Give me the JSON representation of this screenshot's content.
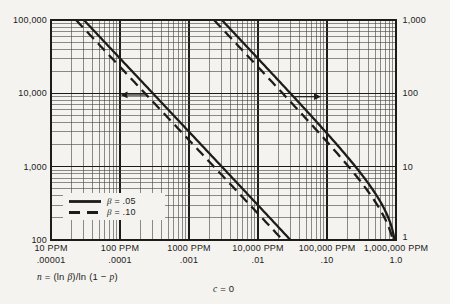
{
  "figure": {
    "paper_color": "#f4f3ef",
    "ink_color": "#1d1c1a",
    "grid_minor_color": "#45423e"
  },
  "chart_data": {
    "type": "line",
    "title": "",
    "equation": "n = (ln β)/ln (1 − p)",
    "grid": {
      "minor": true,
      "scale": "log-log"
    },
    "x_axis": {
      "scale": "log",
      "min": 1e-05,
      "max": 1.0,
      "tick_values": [
        1e-05,
        0.0001,
        0.001,
        0.01,
        0.1,
        1.0
      ],
      "ppm_labels": [
        "10 PPM",
        "100 PPM",
        "1000 PPM",
        "10,000 PPM",
        "100,000 PPM",
        "1,000,000 PPM"
      ],
      "fraction_labels": [
        ".00001",
        ".0001",
        ".001",
        ".01",
        ".10",
        "1.0"
      ]
    },
    "left_axis": {
      "scale": "log",
      "min": 100,
      "max": 100000,
      "tick_values": [
        100000,
        10000,
        1000,
        100
      ],
      "labels": [
        "100,000",
        "10,000",
        "1,000",
        "100"
      ]
    },
    "right_axis": {
      "scale": "log",
      "min": 1,
      "max": 1000,
      "tick_values": [
        1000,
        100,
        10,
        1
      ],
      "labels": [
        "1,000",
        "100",
        "10",
        "1"
      ]
    },
    "series": [
      {
        "name": "beta-05-left",
        "beta": 0.05,
        "style": "solid",
        "axis": "left",
        "points_p_n": [
          [
            3e-05,
            100000
          ],
          [
            0.0003,
            10000
          ],
          [
            0.003,
            1000
          ],
          [
            0.0295,
            100
          ]
        ]
      },
      {
        "name": "beta-10-left",
        "beta": 0.1,
        "style": "dashed",
        "axis": "left",
        "points_p_n": [
          [
            2.3e-05,
            100000
          ],
          [
            0.00023,
            10000
          ],
          [
            0.0023,
            1000
          ],
          [
            0.0228,
            100
          ]
        ]
      },
      {
        "name": "beta-05-right",
        "beta": 0.05,
        "style": "solid",
        "axis": "right",
        "points_p_n": [
          [
            0.003,
            1000
          ],
          [
            0.0295,
            100
          ],
          [
            0.259,
            10
          ],
          [
            0.95,
            1
          ]
        ]
      },
      {
        "name": "beta-10-right",
        "beta": 0.1,
        "style": "dashed",
        "axis": "right",
        "points_p_n": [
          [
            0.0023,
            1000
          ],
          [
            0.0228,
            100
          ],
          [
            0.206,
            10
          ],
          [
            0.9,
            1
          ]
        ]
      }
    ],
    "arrows": [
      {
        "name": "read-left-axis-arrow",
        "direction": "left",
        "at_left_n": 9500
      },
      {
        "name": "read-right-axis-arrow",
        "direction": "right",
        "at_right_n": 90
      }
    ]
  },
  "legend": {
    "items": [
      {
        "style": "solid",
        "var": "β",
        "rest": " = .05"
      },
      {
        "style": "dashed",
        "var": "β",
        "rest": " = .10"
      }
    ]
  },
  "annotations": {
    "formula_parts": [
      {
        "t": "n",
        "i": true
      },
      {
        "t": " = (ln ",
        "i": false
      },
      {
        "t": "β",
        "i": true
      },
      {
        "t": ")/ln (1 − ",
        "i": false
      },
      {
        "t": "p",
        "i": true
      },
      {
        "t": ")",
        "i": false
      }
    ],
    "condition_parts": [
      {
        "t": "c",
        "i": true
      },
      {
        "t": " = 0",
        "i": false
      }
    ]
  }
}
